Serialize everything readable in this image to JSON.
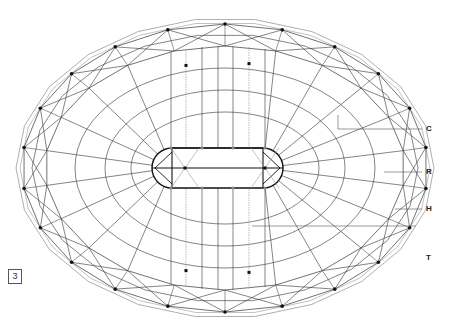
{
  "figure": {
    "number": "3",
    "colors": {
      "background": "#ffffff",
      "line": "#333333",
      "light_line": "#999999",
      "node": "#111111",
      "hub": "#111111"
    }
  },
  "geometry": {
    "center": [
      225,
      168
    ],
    "outer_rx": 209,
    "outer_ry": 150,
    "ring_outer_rx": 203,
    "ring_outer_ry": 144,
    "ring_mid_rx": 193,
    "ring_mid_ry": 134,
    "ring_inner_rx": 180,
    "ring_inner_ry": 122,
    "inner_rings": [
      {
        "rx": 150,
        "ry": 100
      },
      {
        "rx": 120,
        "ry": 78
      },
      {
        "rx": 94,
        "ry": 56
      }
    ],
    "node_count": 22,
    "hub": {
      "x1": 152,
      "x2": 283,
      "y1": 148,
      "y2": 188,
      "radius": 20,
      "inner_nodes": [
        [
          185,
          168
        ],
        [
          265,
          168
        ]
      ],
      "grey_nodes": [
        [
          171,
          148
        ],
        [
          202,
          148
        ],
        [
          233,
          148
        ],
        [
          265,
          148
        ],
        [
          171,
          188
        ],
        [
          202,
          188
        ],
        [
          233,
          188
        ],
        [
          265,
          188
        ]
      ]
    },
    "vertical_lines_x": [
      171,
      186,
      202,
      218,
      233,
      249,
      265
    ],
    "dotted_lines_x": [
      186,
      249
    ]
  },
  "labels": [
    {
      "id": "C",
      "text": "C",
      "x": 426,
      "y": 125,
      "leader": [
        [
          338,
          129
        ],
        [
          422,
          129
        ]
      ],
      "leader_from_corner": [
        338,
        115
      ]
    },
    {
      "id": "R",
      "text": "R",
      "x": 426,
      "y": 168,
      "leader": [
        [
          384,
          172
        ],
        [
          422,
          172
        ]
      ]
    },
    {
      "id": "H",
      "text": "H",
      "x": 426,
      "y": 205,
      "leader": [
        [
          395,
          209
        ],
        [
          422,
          209
        ]
      ]
    },
    {
      "id": "T",
      "text": "T",
      "x": 426,
      "y": 254,
      "leader": [
        [
          252,
          226
        ],
        [
          416,
          226
        ]
      ]
    }
  ]
}
